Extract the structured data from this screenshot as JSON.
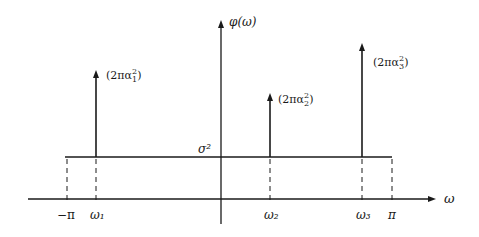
{
  "diagram": {
    "type": "spectral-density-line-spectrum",
    "y_axis_label": "φ(ω)",
    "x_axis_label": "ω",
    "noise_floor_label": "σ²",
    "tick_labels": {
      "neg_pi": "−π",
      "omega1": "ω₁",
      "omega2": "ω₂",
      "omega3": "ω₃",
      "pi": "π"
    },
    "spikes": [
      {
        "position": "ω₁",
        "label_prefix": "(2πα",
        "sub": "1",
        "sup": "2",
        "label_suffix": ")"
      },
      {
        "position": "ω₂",
        "label_prefix": "(2πα",
        "sub": "2",
        "sup": "2",
        "label_suffix": ")"
      },
      {
        "position": "ω₃",
        "label_prefix": "(2πα",
        "sub": "3",
        "sup": "2",
        "label_suffix": ")"
      }
    ],
    "colors": {
      "line": "#1a1a1a",
      "background": "#ffffff"
    }
  }
}
